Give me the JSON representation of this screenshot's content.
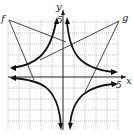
{
  "diagram": {
    "type": "coordinate-graph",
    "axes": {
      "x_label": "x",
      "y_label": "y",
      "x_tick_label": "5",
      "y_tick_label": "5"
    },
    "labels": {
      "f": "f",
      "g": "g"
    },
    "grid": {
      "x_range": [
        -5,
        5
      ],
      "y_range": [
        -5,
        5
      ],
      "step": 1
    },
    "colors": {
      "curve": "#111111",
      "grid": "#9a9a9a",
      "background": "#ffffff"
    }
  }
}
